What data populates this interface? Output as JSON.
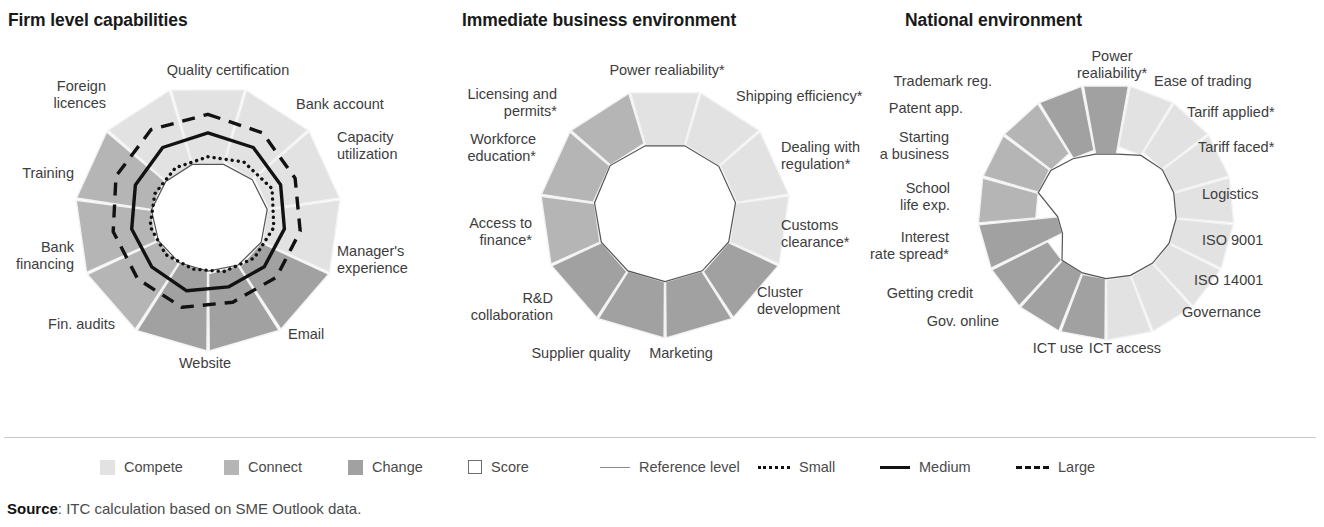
{
  "panels": [
    {
      "title": "Firm level capabilities",
      "labels": [
        {
          "text": "Quality certification",
          "x": 228,
          "y": 62,
          "align": "c"
        },
        {
          "text": "Bank account",
          "x": 296,
          "y": 96,
          "align": "r"
        },
        {
          "text": "Capacity\nutilization",
          "x": 337,
          "y": 129,
          "align": "r"
        },
        {
          "text": "Manager's\nexperience",
          "x": 337,
          "y": 243,
          "align": "r"
        },
        {
          "text": "Email",
          "x": 288,
          "y": 326,
          "align": "r"
        },
        {
          "text": "Website",
          "x": 205,
          "y": 355,
          "align": "c"
        },
        {
          "text": "Fin. audits",
          "x": 115,
          "y": 316,
          "align": "l"
        },
        {
          "text": "Bank\nfinancing",
          "x": 74,
          "y": 239,
          "align": "l"
        },
        {
          "text": "Training",
          "x": 74,
          "y": 165,
          "align": "l"
        },
        {
          "text": "Foreign\nlicences",
          "x": 106,
          "y": 78,
          "align": "l"
        },
        {
          "text": "Quality certification",
          "x": -999,
          "y": -999,
          "align": "c"
        }
      ]
    },
    {
      "title": "Immediate business environment",
      "labels": [
        {
          "text": "Power realiability*",
          "x": 226,
          "y": 62,
          "align": "c"
        },
        {
          "text": "Shipping efficiency*",
          "x": 295,
          "y": 88,
          "align": "r"
        },
        {
          "text": "Dealing with\nregulation*",
          "x": 340,
          "y": 139,
          "align": "r"
        },
        {
          "text": "Customs\nclearance*",
          "x": 340,
          "y": 217,
          "align": "r"
        },
        {
          "text": "Cluster\ndevelopment",
          "x": 316,
          "y": 284,
          "align": "r"
        },
        {
          "text": "Marketing",
          "x": 240,
          "y": 345,
          "align": "c"
        },
        {
          "text": "Supplier quality",
          "x": 140,
          "y": 345,
          "align": "c"
        },
        {
          "text": "R&D\ncollaboration",
          "x": 112,
          "y": 290,
          "align": "l"
        },
        {
          "text": "Access to\nfinance*",
          "x": 91,
          "y": 215,
          "align": "l"
        },
        {
          "text": "Workforce\neducation*",
          "x": 95,
          "y": 131,
          "align": "l"
        },
        {
          "text": "Licensing and\npermits*",
          "x": 116,
          "y": 86,
          "align": "l"
        }
      ]
    },
    {
      "title": "National environment",
      "labels": [
        {
          "text": "Power\nrealiability*",
          "x": 230,
          "y": 48,
          "align": "c"
        },
        {
          "text": "Ease of trading",
          "x": 272,
          "y": 73,
          "align": "r"
        },
        {
          "text": "Tariff applied*",
          "x": 305,
          "y": 104,
          "align": "r"
        },
        {
          "text": "Tariff faced*",
          "x": 316,
          "y": 139,
          "align": "r"
        },
        {
          "text": "Logistics",
          "x": 320,
          "y": 186,
          "align": "r"
        },
        {
          "text": "ISO 9001",
          "x": 320,
          "y": 232,
          "align": "r"
        },
        {
          "text": "ISO 14001",
          "x": 312,
          "y": 272,
          "align": "r"
        },
        {
          "text": "Governance",
          "x": 300,
          "y": 304,
          "align": "r"
        },
        {
          "text": "ICT access",
          "x": 243,
          "y": 340,
          "align": "c"
        },
        {
          "text": "ICT use",
          "x": 176,
          "y": 340,
          "align": "c"
        },
        {
          "text": "Gov. online",
          "x": 117,
          "y": 313,
          "align": "l"
        },
        {
          "text": "Getting credit",
          "x": 91,
          "y": 285,
          "align": "l"
        },
        {
          "text": "Interest\nrate spread*",
          "x": 67,
          "y": 229,
          "align": "l"
        },
        {
          "text": "School\nlife exp.",
          "x": 68,
          "y": 180,
          "align": "l"
        },
        {
          "text": "Starting\na business",
          "x": 67,
          "y": 129,
          "align": "l"
        },
        {
          "text": "Patent app.",
          "x": 81,
          "y": 100,
          "align": "l"
        },
        {
          "text": "Trademark reg.",
          "x": 110,
          "y": 73,
          "align": "l"
        }
      ]
    }
  ],
  "legend": {
    "items": [
      {
        "label": "Compete",
        "kind": "swatch",
        "color": "#e2e2e2"
      },
      {
        "label": "Connect",
        "kind": "swatch",
        "color": "#b5b5b5"
      },
      {
        "label": "Change",
        "kind": "swatch",
        "color": "#a1a1a1"
      },
      {
        "label": "Score",
        "kind": "outline",
        "color": "#ffffff"
      },
      {
        "label": "Reference level",
        "kind": "line-ref",
        "color": "#8a8a8a"
      },
      {
        "label": "Small",
        "kind": "line-small",
        "color": "#111111"
      },
      {
        "label": "Medium",
        "kind": "line-med",
        "color": "#111111"
      },
      {
        "label": "Large",
        "kind": "line-large",
        "color": "#111111"
      }
    ]
  },
  "source": {
    "prefix": "Source",
    "text": ": ITC calculation based on SME Outlook data."
  },
  "colors": {
    "compete": "#e2e2e2",
    "connect": "#b5b5b5",
    "change": "#a1a1a1",
    "score": "#ffffff",
    "reference": "#555555",
    "separator": "#f2f2f2",
    "text": "#3d3d3d"
  },
  "chart_data": [
    {
      "type": "radar",
      "title": "Firm level capabilities",
      "rmax": 100,
      "categories": [
        "Quality certification",
        "Bank account",
        "Capacity utilization",
        "Manager's experience",
        "Email",
        "Website",
        "Fin. audits",
        "Bank financing",
        "Training",
        "Foreign licences",
        "Mobile"
      ],
      "pillars": [
        "compete",
        "compete",
        "compete",
        "compete",
        "change",
        "change",
        "change",
        "connect",
        "connect",
        "connect",
        "compete"
      ],
      "series": [
        {
          "name": "Reference level",
          "style": "thin",
          "values": [
            62,
            58,
            55,
            57,
            54,
            52,
            56,
            54,
            56,
            58,
            60
          ]
        },
        {
          "name": "Small",
          "style": "dotted",
          "values": [
            46,
            50,
            53,
            50,
            46,
            42,
            40,
            42,
            44,
            44,
            45
          ]
        },
        {
          "name": "Medium",
          "style": "solid",
          "values": [
            64,
            63,
            60,
            58,
            56,
            54,
            57,
            56,
            58,
            60,
            63
          ]
        },
        {
          "name": "Large",
          "style": "dashed",
          "values": [
            78,
            76,
            72,
            70,
            68,
            66,
            70,
            70,
            72,
            76,
            79
          ]
        }
      ],
      "legend_position": "below-figure",
      "grid": false
    },
    {
      "type": "radar",
      "title": "Immediate business environment",
      "rmax": 100,
      "categories": [
        "Power realiability*",
        "Shipping efficiency*",
        "Dealing with regulation*",
        "Customs clearance*",
        "Cluster development",
        "Marketing",
        "Supplier quality",
        "R&D collaboration",
        "Access to finance*",
        "Workforce education*",
        "Licensing and permits*"
      ],
      "pillars": [
        "compete",
        "compete",
        "compete",
        "compete",
        "change",
        "change",
        "change",
        "change",
        "connect",
        "connect",
        "connect"
      ],
      "series": [
        {
          "name": "Reference level",
          "style": "thin",
          "values": [
            52,
            52,
            53,
            52,
            52,
            51,
            51,
            52,
            52,
            53,
            53
          ]
        }
      ],
      "legend_position": "below-figure",
      "grid": false
    },
    {
      "type": "radar",
      "title": "National environment",
      "rmax": 100,
      "categories": [
        "Power realiability*",
        "Ease of trading",
        "Tariff applied*",
        "Tariff faced*",
        "Logistics",
        "ISO 9001",
        "ISO 14001",
        "Governance",
        "ICT access",
        "ICT use",
        "Gov. online",
        "Getting credit",
        "Interest rate spread*",
        "School life exp.",
        "Starting a business",
        "Patent app.",
        "Trademark reg."
      ],
      "pillars": [
        "change",
        "compete",
        "compete",
        "compete",
        "compete",
        "compete",
        "compete",
        "compete",
        "compete",
        "change",
        "change",
        "change",
        "change",
        "connect",
        "connect",
        "connect",
        "change"
      ],
      "series": [
        {
          "name": "Reference level",
          "style": "thin",
          "values": [
            44,
            48,
            50,
            50,
            50,
            50,
            50,
            49,
            48,
            48,
            47,
            47,
            40,
            50,
            50,
            50,
            46
          ]
        }
      ],
      "legend_position": "below-figure",
      "grid": false
    }
  ]
}
